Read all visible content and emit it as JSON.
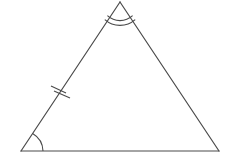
{
  "diagram": {
    "type": "geometry",
    "shape": "triangle",
    "title": "",
    "stroke_color": "#4a4a4a",
    "background": "#ffffff",
    "vertices": {
      "apex": {
        "x": 120,
        "y": 2
      },
      "bottom_left": {
        "x": 21,
        "y": 151
      },
      "bottom_right": {
        "x": 219,
        "y": 151
      }
    },
    "markings": {
      "apex_angle": {
        "arcs": 2,
        "meaning": "angle mark (double arc)"
      },
      "bottom_left_angle": {
        "arcs": 1,
        "meaning": "angle mark (single arc)"
      },
      "bottom_right_angle": {
        "arcs": 0
      },
      "left_side_ticks": {
        "count": 2,
        "meaning": "congruence tick marks (double)"
      }
    },
    "labels": []
  }
}
